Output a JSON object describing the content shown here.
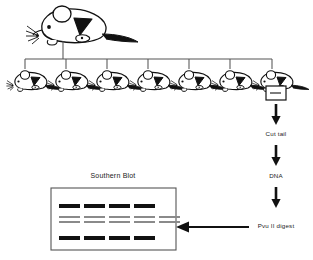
{
  "diagram": {
    "type": "flow-diagram",
    "background_color": "#ffffff",
    "ink_color": "#111111"
  },
  "founder": {
    "name": "founder-mouse",
    "count": 1,
    "label": ""
  },
  "offspring": {
    "name": "offspring-mice",
    "count": 7,
    "label": ""
  },
  "sample_box": {
    "label": "",
    "name": "tail-sample-box"
  },
  "steps": [
    {
      "id": "cut-tail",
      "label": "Cut tail"
    },
    {
      "id": "dna",
      "label": "DNA"
    },
    {
      "id": "pvu-digest",
      "label": "Pvu II digest"
    }
  ],
  "blot": {
    "title": "Southern Blot",
    "lane_count": 5,
    "rows": [
      {
        "id": "upper-band-row",
        "shade": "dark",
        "lanes": [
          1,
          1,
          1,
          1,
          0
        ]
      },
      {
        "id": "middle-band-row-a",
        "shade": "gray",
        "lanes": [
          1,
          1,
          1,
          1,
          1
        ]
      },
      {
        "id": "middle-band-row-b",
        "shade": "gray",
        "lanes": [
          1,
          1,
          1,
          1,
          1
        ]
      },
      {
        "id": "lower-band-row",
        "shade": "dark",
        "lanes": [
          1,
          1,
          1,
          1,
          0
        ]
      }
    ],
    "band_color_dark": "#111111",
    "band_color_gray": "#8a8a8a",
    "border_color": "#555555"
  },
  "arrows": {
    "down_1": "arrow-down-to-cut-tail",
    "down_2": "arrow-down-to-dna",
    "down_3": "arrow-down-to-digest",
    "left_1": "arrow-left-to-blot"
  }
}
